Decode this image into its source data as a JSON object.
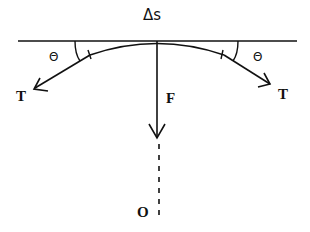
{
  "diagram": {
    "type": "physics-free-body",
    "labels": {
      "arc_length": "Δs",
      "angle_left": "Θ",
      "angle_right": "Θ",
      "tension_left": "T",
      "tension_right": "T",
      "force": "F",
      "center": "O"
    },
    "colors": {
      "stroke": "#111111",
      "background": "#ffffff"
    }
  }
}
